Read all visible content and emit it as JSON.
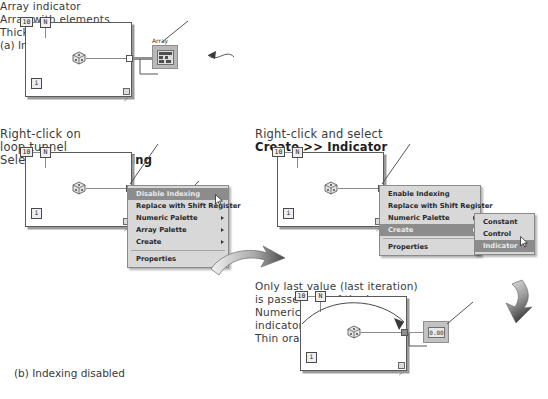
{
  "figure": {
    "panel_a_caption": "(a) Indexing enabled",
    "panel_b_caption": "(b) Indexing disabled"
  },
  "loop_terminals": {
    "count_constant": "10",
    "count_terminal": "N",
    "iteration_terminal": "i"
  },
  "panel_a": {
    "annotations": {
      "array_indicator": "Array indicator",
      "array_with_elements": "Array with elements",
      "thick_orange_wire": "Thick orange wire"
    },
    "array_indicator_label": "Array"
  },
  "panel_b": {
    "annotations": {
      "right_click_line1": "Right-click on",
      "right_click_line2": "loop tunnel",
      "select_prefix": "Select ",
      "select_bold": "Disable Indexing",
      "right_click_select_line1": "Right-click and select",
      "right_click_select_bold": "Create >> Indicator",
      "last_value_line1": "Only last value (last iteration)",
      "last_value_line2": "is passed out of the loop",
      "numeric_indicator_line1": "Numeric",
      "numeric_indicator_line2": "indicator",
      "thin_orange_wire": "Thin orange wire"
    },
    "numeric_indicator_value": "0.00"
  },
  "context_menu_left": {
    "items": [
      {
        "label": "Disable Indexing",
        "selected": true,
        "submenu": false
      },
      {
        "label": "Replace with Shift Register",
        "selected": false,
        "submenu": false
      },
      {
        "label": "Numeric Palette",
        "selected": false,
        "submenu": true
      },
      {
        "label": "Array Palette",
        "selected": false,
        "submenu": true
      },
      {
        "label": "Create",
        "selected": false,
        "submenu": true
      }
    ],
    "after_separator": [
      {
        "label": "Properties",
        "selected": false,
        "submenu": false
      }
    ]
  },
  "context_menu_right": {
    "items": [
      {
        "label": "Enable Indexing",
        "selected": false,
        "submenu": false
      },
      {
        "label": "Replace with Shift Register",
        "selected": false,
        "submenu": false
      },
      {
        "label": "Numeric Palette",
        "selected": false,
        "submenu": true
      },
      {
        "label": "Create",
        "selected": true,
        "submenu": true
      }
    ],
    "after_separator": [
      {
        "label": "Properties",
        "selected": false,
        "submenu": false
      }
    ],
    "submenu": {
      "items": [
        {
          "label": "Constant",
          "selected": false
        },
        {
          "label": "Control",
          "selected": false
        },
        {
          "label": "Indicator",
          "selected": true
        }
      ]
    }
  },
  "colors": {
    "menu_background": "#d8d8d8",
    "menu_selected": "#8c8c8c",
    "wire": "#8f8f8f",
    "loop_border": "#5a5a5a",
    "indicator_body": "#b9b9b9"
  }
}
